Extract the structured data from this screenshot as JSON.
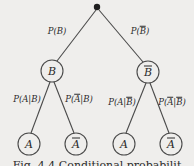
{
  "figure": {
    "type": "probability-tree-diagram",
    "background_color": "#efeeec",
    "line_color": "#4a4a4a",
    "text_color": "#2b2b2b",
    "caption": "Fig. 4.4  Conditional probabilit",
    "root": {
      "name": "root-node",
      "shape": "filled-dot",
      "x": 97,
      "y": 7
    },
    "nodes": [
      {
        "id": "B",
        "label": "B",
        "overline": false,
        "x": 52,
        "y": 71,
        "r": 11
      },
      {
        "id": "Bbar",
        "label": "B",
        "overline": true,
        "x": 148,
        "y": 72,
        "r": 11
      },
      {
        "id": "A-left",
        "label": "A",
        "overline": false,
        "x": 29,
        "y": 144,
        "r": 11
      },
      {
        "id": "Abar-l",
        "label": "A",
        "overline": true,
        "x": 76,
        "y": 144,
        "r": 11
      },
      {
        "id": "A-right",
        "label": "A",
        "overline": false,
        "x": 124,
        "y": 144,
        "r": 11
      },
      {
        "id": "Abar-r",
        "label": "A",
        "overline": true,
        "x": 171,
        "y": 144,
        "r": 11
      }
    ],
    "edges": [
      {
        "from": "root",
        "to": "B",
        "name": "edge-root-to-B"
      },
      {
        "from": "root",
        "to": "Bbar",
        "name": "edge-root-to-Bbar"
      },
      {
        "from": "B",
        "to": "A-left",
        "name": "edge-B-to-A"
      },
      {
        "from": "B",
        "to": "Abar-l",
        "name": "edge-B-to-Abar"
      },
      {
        "from": "Bbar",
        "to": "A-right",
        "name": "edge-Bbar-to-A"
      },
      {
        "from": "Bbar",
        "to": "Abar-r",
        "name": "edge-Bbar-to-Abar"
      }
    ],
    "edge_labels": [
      {
        "id": "label-P-B",
        "prefix": "P(",
        "main": "B",
        "main_overline": false,
        "cond": "",
        "cond_overline": false,
        "suffix": ")",
        "text": "P(B)",
        "x": 57,
        "y": 31
      },
      {
        "id": "label-P-Bbar",
        "prefix": "P(",
        "main": "B",
        "main_overline": true,
        "cond": "",
        "cond_overline": false,
        "suffix": ")",
        "text": "P(B̄)",
        "x": 140,
        "y": 31
      },
      {
        "id": "label-P-A-given-B",
        "prefix": "P(",
        "main": "A",
        "main_overline": false,
        "cond": "B",
        "cond_overline": false,
        "suffix": ")",
        "text": "P(A|B)",
        "x": 27,
        "y": 99
      },
      {
        "id": "label-P-Abar-given-B",
        "prefix": "P(",
        "main": "A",
        "main_overline": true,
        "cond": "B",
        "cond_overline": false,
        "suffix": ")",
        "text": "P(Ā|B)",
        "x": 79,
        "y": 99
      },
      {
        "id": "label-P-A-given-Bbar",
        "prefix": "P(",
        "main": "A",
        "main_overline": false,
        "cond": "B",
        "cond_overline": true,
        "suffix": ")",
        "text": "P(A|B̄)",
        "x": 122,
        "y": 102
      },
      {
        "id": "label-P-Abar-given-Bbar",
        "prefix": "P(",
        "main": "A",
        "main_overline": true,
        "cond": "B",
        "cond_overline": true,
        "suffix": ")",
        "text": "P(Ā|B̄)",
        "x": 172,
        "y": 102
      }
    ]
  }
}
